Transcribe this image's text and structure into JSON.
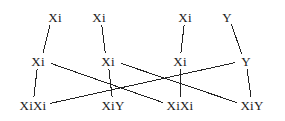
{
  "diagram": {
    "kind": "genetics-cross-lattice",
    "width": 285,
    "height": 121,
    "background_color": "#ffffff",
    "line_color": "#222222",
    "text_color": "#1a1a1a",
    "rows": [
      {
        "name": "parent-gametes-row",
        "y": 17,
        "nodes": [
          {
            "id": "t1",
            "label": "Xi",
            "x": 55
          },
          {
            "id": "t2",
            "label": "Xi",
            "x": 99
          },
          {
            "id": "t3",
            "label": "Xi",
            "x": 185
          },
          {
            "id": "t4",
            "label": "Y",
            "x": 227
          }
        ]
      },
      {
        "name": "gamete-row",
        "y": 61,
        "nodes": [
          {
            "id": "m1",
            "label": "Xi",
            "x": 38
          },
          {
            "id": "m2",
            "label": "Xi",
            "x": 108
          },
          {
            "id": "m3",
            "label": "Xi",
            "x": 180
          },
          {
            "id": "m4",
            "label": "Y",
            "x": 246
          }
        ]
      },
      {
        "name": "offspring-row",
        "y": 105,
        "nodes": [
          {
            "id": "b1",
            "label": "XiXi",
            "x": 33
          },
          {
            "id": "b2",
            "label": "XiY",
            "x": 113
          },
          {
            "id": "b3",
            "label": "XiXi",
            "x": 180
          },
          {
            "id": "b4",
            "label": "XiY",
            "x": 252
          }
        ]
      }
    ],
    "edges": [
      {
        "from": "t1",
        "to": "m1"
      },
      {
        "from": "t2",
        "to": "m2"
      },
      {
        "from": "t3",
        "to": "m3"
      },
      {
        "from": "t4",
        "to": "m4"
      },
      {
        "from": "m1",
        "to": "b1"
      },
      {
        "from": "m1",
        "to": "b3"
      },
      {
        "from": "m2",
        "to": "b2"
      },
      {
        "from": "m2",
        "to": "b4"
      },
      {
        "from": "m3",
        "to": "b3"
      },
      {
        "from": "m4",
        "to": "b1"
      },
      {
        "from": "m4",
        "to": "b4"
      }
    ]
  }
}
